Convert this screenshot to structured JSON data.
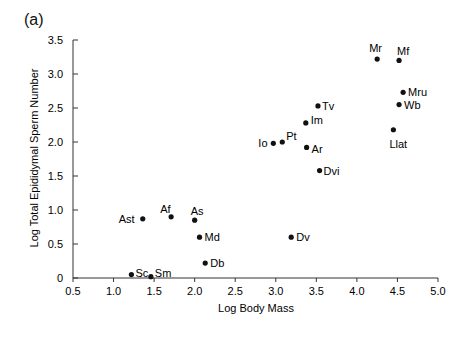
{
  "panel_label": "(a)",
  "chart_data": {
    "type": "scatter",
    "title": "",
    "xlabel": "Log Body Mass",
    "ylabel": "Log Total Epididymal Sperm Number",
    "xlim": [
      0.5,
      5.0
    ],
    "ylim": [
      0,
      3.5
    ],
    "xticks": [
      "0.5",
      "1.0",
      "1.5",
      "2.0",
      "2.5",
      "3.0",
      "3.5",
      "4.0",
      "4.5",
      "5.0"
    ],
    "yticks": [
      "0",
      "0.5",
      "1.0",
      "1.5",
      "2.0",
      "2.5",
      "3.0",
      "3.5"
    ],
    "grid": false,
    "points": [
      {
        "label": "Sc",
        "x": 1.22,
        "y": 0.05,
        "lx": 4,
        "ly": -2
      },
      {
        "label": "Sm",
        "x": 1.46,
        "y": 0.02,
        "lx": 4,
        "ly": -4
      },
      {
        "label": "Ast",
        "x": 1.36,
        "y": 0.87,
        "lx": -24,
        "ly": 0
      },
      {
        "label": "Af",
        "x": 1.71,
        "y": 0.9,
        "lx": -11,
        "ly": -8
      },
      {
        "label": "As",
        "x": 2.0,
        "y": 0.85,
        "lx": -4,
        "ly": -9
      },
      {
        "label": "Md",
        "x": 2.06,
        "y": 0.6,
        "lx": 5,
        "ly": 0
      },
      {
        "label": "Db",
        "x": 2.13,
        "y": 0.22,
        "lx": 5,
        "ly": 0
      },
      {
        "label": "Dv",
        "x": 3.19,
        "y": 0.6,
        "lx": 5,
        "ly": 0
      },
      {
        "label": "Io",
        "x": 2.97,
        "y": 1.98,
        "lx": -15,
        "ly": 0
      },
      {
        "label": "Pt",
        "x": 3.08,
        "y": 2.0,
        "lx": 4,
        "ly": -6
      },
      {
        "label": "Im",
        "x": 3.37,
        "y": 2.28,
        "lx": 5,
        "ly": -3
      },
      {
        "label": "Tv",
        "x": 3.52,
        "y": 2.53,
        "lx": 4,
        "ly": 0
      },
      {
        "label": "Ar",
        "x": 3.38,
        "y": 1.92,
        "lx": 5,
        "ly": 2
      },
      {
        "label": "Dvi",
        "x": 3.54,
        "y": 1.58,
        "lx": 4,
        "ly": 0
      },
      {
        "label": "Mr",
        "x": 4.25,
        "y": 3.22,
        "lx": -8,
        "ly": -11
      },
      {
        "label": "Mf",
        "x": 4.52,
        "y": 3.2,
        "lx": -2,
        "ly": -9
      },
      {
        "label": "Mru",
        "x": 4.57,
        "y": 2.73,
        "lx": 5,
        "ly": 0
      },
      {
        "label": "Wb",
        "x": 4.52,
        "y": 2.55,
        "lx": 5,
        "ly": 0
      },
      {
        "label": "Llat",
        "x": 4.45,
        "y": 2.18,
        "lx": -4,
        "ly": 14
      }
    ]
  }
}
